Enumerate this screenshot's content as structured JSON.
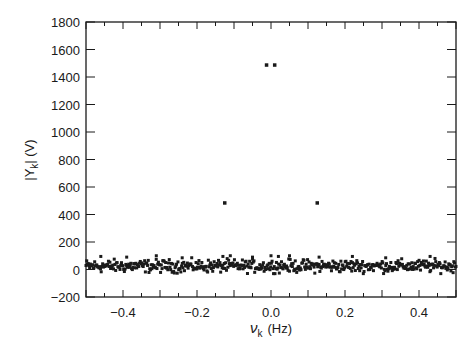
{
  "chart_data": {
    "type": "scatter",
    "title": "",
    "xlabel": "ν_k (Hz)",
    "xlabel_symbol": "ν",
    "xlabel_sub": "k",
    "xlabel_unit": "(Hz)",
    "ylabel": "|Y_k| (V)",
    "ylabel_pre": "|Y",
    "ylabel_sub": "k",
    "ylabel_post": "| (V)",
    "xlim": [
      -0.5,
      0.5
    ],
    "ylim": [
      -200,
      1800
    ],
    "xticks": [
      -0.4,
      -0.2,
      0.0,
      0.2,
      0.4
    ],
    "xtick_labels": [
      "−0.4",
      "−0.2",
      "0.0",
      "0.2",
      "0.4"
    ],
    "yticks": [
      -200,
      0,
      200,
      400,
      600,
      800,
      1000,
      1200,
      1400,
      1600,
      1800
    ],
    "ytick_labels": [
      "−200",
      "0",
      "200",
      "400",
      "600",
      "800",
      "1000",
      "1200",
      "1400",
      "1600",
      "1800"
    ],
    "grid": false,
    "legend": null,
    "marker": "square",
    "marker_color": "#1a1a1a",
    "peaks": [
      {
        "x": -0.125,
        "y": 484
      },
      {
        "x": -0.012,
        "y": 1487
      },
      {
        "x": 0.01,
        "y": 1487
      },
      {
        "x": 0.125,
        "y": 484
      }
    ],
    "noise_floor": {
      "x_start": -0.5,
      "x_end": 0.5,
      "count": 512,
      "mean": 25,
      "spread": 45,
      "outlier_max": 100
    },
    "outliers": [
      {
        "x": -0.46,
        "y": 95
      },
      {
        "x": -0.39,
        "y": 90
      },
      {
        "x": -0.31,
        "y": 100
      },
      {
        "x": -0.24,
        "y": 85
      },
      {
        "x": -0.13,
        "y": 95
      },
      {
        "x": -0.11,
        "y": 100
      },
      {
        "x": -0.05,
        "y": 90
      },
      {
        "x": 0.0,
        "y": 100
      },
      {
        "x": 0.02,
        "y": 95
      },
      {
        "x": 0.05,
        "y": 100
      },
      {
        "x": 0.13,
        "y": 90
      },
      {
        "x": 0.22,
        "y": 95
      },
      {
        "x": 0.31,
        "y": 85
      },
      {
        "x": 0.43,
        "y": 95
      }
    ]
  }
}
